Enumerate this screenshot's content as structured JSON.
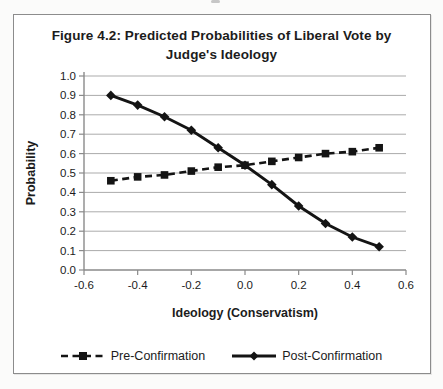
{
  "figure": {
    "title_line1": "Figure 4.2: Predicted Probabilities of Liberal Vote by",
    "title_line2": "Judge's Ideology"
  },
  "chart_data": {
    "type": "line",
    "title": "Figure 4.2: Predicted Probabilities of Liberal Vote by Judge's Ideology",
    "xlabel": "Ideology (Conservatism)",
    "ylabel": "Probability",
    "xlim": [
      -0.6,
      0.6
    ],
    "ylim": [
      0.0,
      1.0
    ],
    "xticks": [
      "-0.6",
      "-0.4",
      "-0.2",
      "0.0",
      "0.2",
      "0.4",
      "0.6"
    ],
    "yticks": [
      "0.0",
      "0.1",
      "0.2",
      "0.3",
      "0.4",
      "0.5",
      "0.6",
      "0.7",
      "0.8",
      "0.9",
      "1.0"
    ],
    "grid": "horizontal",
    "legend_position": "bottom",
    "x": [
      -0.5,
      -0.4,
      -0.3,
      -0.2,
      -0.1,
      0.0,
      0.1,
      0.2,
      0.3,
      0.4,
      0.5
    ],
    "series": [
      {
        "name": "Pre-Confirmation",
        "line_style": "dashed",
        "marker": "square",
        "color": "#141414",
        "values": [
          0.46,
          0.48,
          0.49,
          0.51,
          0.53,
          0.54,
          0.56,
          0.58,
          0.6,
          0.61,
          0.63
        ]
      },
      {
        "name": "Post-Confirmation",
        "line_style": "solid",
        "marker": "diamond",
        "color": "#141414",
        "values": [
          0.9,
          0.85,
          0.79,
          0.72,
          0.63,
          0.54,
          0.44,
          0.33,
          0.24,
          0.17,
          0.12
        ]
      }
    ]
  },
  "colors": {
    "line": "#141414",
    "grid": "#ababab",
    "axis": "#8a8a8a",
    "text": "#1c1c1c",
    "figure_background": "#ffffff",
    "figure_border": "#8c8c8c"
  }
}
